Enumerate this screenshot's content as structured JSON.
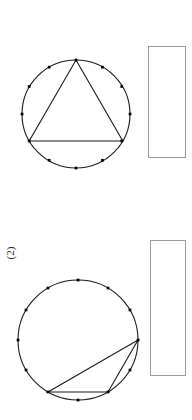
{
  "page": {
    "background_color": "#ffffff",
    "width": 192,
    "height": 420
  },
  "figures": [
    {
      "id": "figure-top",
      "name": "circle-with-inscribed-equilateral-triangle",
      "label": "",
      "circle": {
        "center_x": 76,
        "center_y": 114,
        "radius": 54,
        "stroke_color": "#1a1a1a",
        "stroke_width": 1
      },
      "point_count": 12,
      "point_color": "#000000",
      "point_size": 2.6,
      "point_angles_deg": [
        270,
        300,
        330,
        0,
        30,
        60,
        90,
        120,
        150,
        180,
        210,
        240
      ],
      "triangle": {
        "vertex_angles_deg": [
          270,
          30,
          150
        ],
        "stroke_color": "#1a1a1a",
        "stroke_width": 1,
        "fill": "none"
      }
    },
    {
      "id": "figure-bottom",
      "name": "circle-with-inscribed-obtuse-triangle",
      "label": "",
      "circle": {
        "center_x": 78,
        "center_y": 70,
        "radius": 60,
        "stroke_color": "#1a1a1a",
        "stroke_width": 1
      },
      "point_count": 12,
      "point_color": "#000000",
      "point_size": 2.6,
      "point_angles_deg": [
        270,
        300,
        330,
        0,
        30,
        60,
        90,
        120,
        150,
        180,
        210,
        240
      ],
      "triangle": {
        "vertex_angles_deg": [
          0,
          60,
          90
        ],
        "stroke_color": "#1a1a1a",
        "stroke_width": 1,
        "fill": "none"
      }
    }
  ],
  "labels": {
    "figure_two": "(2)"
  },
  "blank_boxes": [
    {
      "id": "blank-box-top",
      "name": "answer-box-top",
      "border_color": "#9a9a9a",
      "fill_color": "#ffffff",
      "content": ""
    },
    {
      "id": "blank-box-bottom",
      "name": "answer-box-bottom",
      "border_color": "#9a9a9a",
      "fill_color": "#ffffff",
      "content": ""
    }
  ]
}
